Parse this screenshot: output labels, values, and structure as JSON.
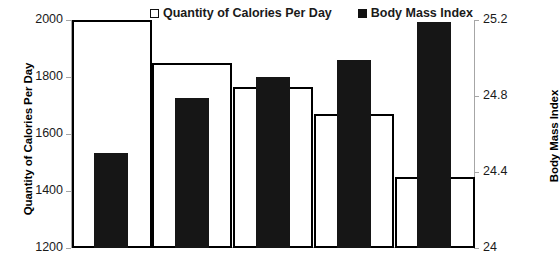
{
  "chart_data": {
    "type": "bar",
    "title": "",
    "categories": [
      "1",
      "2",
      "3",
      "4",
      "5"
    ],
    "series": [
      {
        "name": "Quantity of Calories Per Day",
        "axis": "left",
        "style": "open",
        "color": "#ffffff",
        "edge_color": "#000000",
        "values": [
          2000,
          1850,
          1765,
          1670,
          1450
        ]
      },
      {
        "name": "Body Mass Index",
        "axis": "right",
        "style": "filled",
        "color": "#161616",
        "values": [
          24.5,
          24.79,
          24.9,
          24.99,
          25.19
        ]
      }
    ],
    "xlabel": "",
    "ylabel": "Quantity of Calories Per Day",
    "y2label": "Body Mass Index",
    "ylim": [
      1200,
      2000
    ],
    "y2lim": [
      24,
      25.2
    ],
    "yticks": [
      "1200",
      "1400",
      "1600",
      "1800",
      "2000"
    ],
    "y2ticks": [
      "24",
      "24.4",
      "24.8",
      "25.2"
    ],
    "ytick_values": [
      1200,
      1400,
      1600,
      1800,
      2000
    ],
    "y2tick_values": [
      24,
      24.4,
      24.8,
      25.2
    ],
    "grid": false,
    "legend_position": "top-center",
    "xtick_labels_visible": false
  },
  "legend": {
    "entries": [
      {
        "label": "Quantity of Calories Per Day",
        "marker": "open-square"
      },
      {
        "label": "Body Mass Index",
        "marker": "filled-square"
      }
    ]
  },
  "axes": {
    "left_title": "Quantity of Calories Per Day",
    "right_title": "Body Mass Index"
  }
}
